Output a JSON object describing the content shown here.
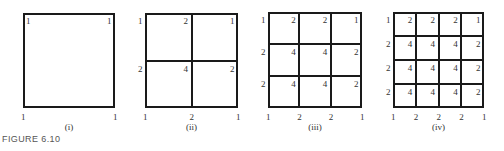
{
  "figure_label": "FIGURE 6.10",
  "panels": [
    {
      "caption": "(i)",
      "divisions": 1,
      "weights": [
        [
          1,
          1
        ],
        [
          1,
          1
        ]
      ]
    },
    {
      "caption": "(ii)",
      "divisions": 2,
      "weights": [
        [
          1,
          2,
          1
        ],
        [
          2,
          4,
          2
        ],
        [
          1,
          2,
          1
        ]
      ]
    },
    {
      "caption": "(iii)",
      "divisions": 3,
      "weights": [
        [
          1,
          2,
          2,
          1
        ],
        [
          2,
          4,
          4,
          2
        ],
        [
          2,
          4,
          4,
          2
        ],
        [
          1,
          2,
          2,
          1
        ]
      ]
    },
    {
      "caption": "(iv)",
      "divisions": 4,
      "weights": [
        [
          1,
          2,
          2,
          2,
          1
        ],
        [
          2,
          4,
          4,
          4,
          2
        ],
        [
          2,
          4,
          4,
          4,
          2
        ],
        [
          2,
          4,
          4,
          4,
          2
        ],
        [
          1,
          2,
          2,
          2,
          1
        ]
      ]
    }
  ]
}
